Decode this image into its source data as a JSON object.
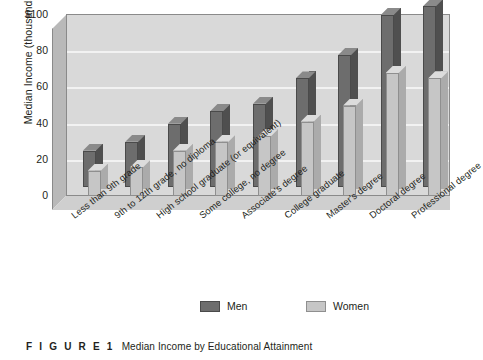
{
  "figure": {
    "number_label": "F I G U R E  1",
    "caption": "Median Income by Educational Attainment"
  },
  "legend": {
    "position": "bottom",
    "entries": [
      {
        "label": "Men",
        "color": "#6d6d6d"
      },
      {
        "label": "Women",
        "color": "#c6c6c6"
      }
    ]
  },
  "axes": {
    "ylabel": "Median Income (thousands)",
    "yticks": [
      "$100",
      "80",
      "60",
      "40",
      "20",
      "0"
    ]
  },
  "colors": {
    "men": "#6d6d6d",
    "women": "#c6c6c6",
    "plot_background": "#d9d9d9",
    "gridline": "#f2f2f2",
    "frame": "#8a8a8a",
    "text": "#231f20"
  },
  "chart_data": {
    "type": "bar",
    "title": "Median Income by Educational Attainment",
    "xlabel": "",
    "ylabel": "Median Income (thousands)",
    "ylim": [
      0,
      100
    ],
    "grid": true,
    "legend_position": "bottom",
    "style": "3d-grouped-columns",
    "categories": [
      "Less than 9th grade",
      "9th to 12th grade, no diploma",
      "High school graduate (or equivalent)",
      "Some college, no degree",
      "Associate's degree",
      "College graduate",
      "Master's degree",
      "Doctoral degree",
      "Professional degree"
    ],
    "series": [
      {
        "name": "Men",
        "values": [
          20,
          25,
          35,
          42,
          46,
          60,
          73,
          95,
          100
        ]
      },
      {
        "name": "Women",
        "values": [
          14,
          16,
          25,
          30,
          33,
          41,
          50,
          68,
          65
        ]
      }
    ]
  }
}
